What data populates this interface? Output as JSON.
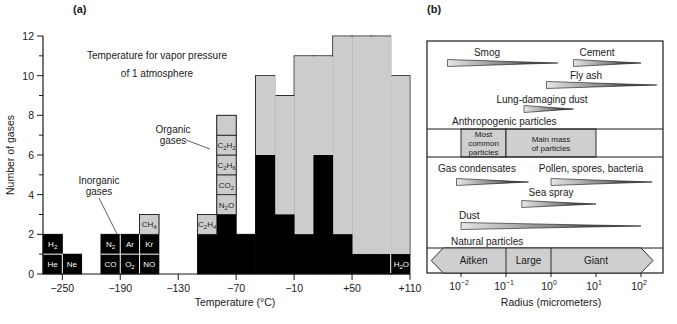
{
  "chart_data": [
    {
      "panel": "(a)",
      "type": "bar",
      "subtype": "stacked histogram",
      "title": "Temperature for vapor pressure of 1 atmosphere",
      "xlabel": "Temperature (°C)",
      "ylabel": "Number of gases",
      "xlim": [
        -270,
        110
      ],
      "ylim": [
        0,
        12
      ],
      "xticks": [
        -250,
        -190,
        -130,
        -70,
        -10,
        50,
        110
      ],
      "xtick_labels": [
        "−250",
        "−190",
        "−130",
        "−70",
        "−10",
        "+50",
        "+110"
      ],
      "yticks": [
        0,
        2,
        4,
        6,
        8,
        10,
        12
      ],
      "ytick_labels": [
        "0",
        "2",
        "4",
        "6",
        "8",
        "10",
        "12"
      ],
      "bin_width": 20,
      "bins": [
        {
          "x0": -270,
          "inorganic": 2,
          "organic": 0
        },
        {
          "x0": -250,
          "inorganic": 1,
          "organic": 0
        },
        {
          "x0": -210,
          "inorganic": 2,
          "organic": 0
        },
        {
          "x0": -190,
          "inorganic": 2,
          "organic": 0
        },
        {
          "x0": -170,
          "inorganic": 2,
          "organic": 1
        },
        {
          "x0": -110,
          "inorganic": 2,
          "organic": 1
        },
        {
          "x0": -90,
          "inorganic": 3,
          "organic": 5
        },
        {
          "x0": -70,
          "inorganic": 2,
          "organic": 0
        },
        {
          "x0": -50,
          "inorganic": 6,
          "organic": 4
        },
        {
          "x0": -30,
          "inorganic": 3,
          "organic": 6
        },
        {
          "x0": -10,
          "inorganic": 2,
          "organic": 9
        },
        {
          "x0": 10,
          "inorganic": 6,
          "organic": 5
        },
        {
          "x0": 30,
          "inorganic": 2,
          "organic": 10
        },
        {
          "x0": 50,
          "inorganic": 1,
          "organic": 11
        },
        {
          "x0": 70,
          "inorganic": 1,
          "organic": 11
        },
        {
          "x0": 90,
          "inorganic": 1,
          "organic": 9
        }
      ],
      "series": [
        {
          "name": "Inorganic gases",
          "color": "#000000"
        },
        {
          "name": "Organic gases",
          "color": "#cccccc"
        }
      ],
      "cell_labels": [
        {
          "x0": -270,
          "level": 0,
          "text": "He",
          "sub": ""
        },
        {
          "x0": -270,
          "level": 1,
          "text": "H",
          "sub": "2"
        },
        {
          "x0": -250,
          "level": 0,
          "text": "Ne",
          "sub": ""
        },
        {
          "x0": -210,
          "level": 0,
          "text": "CO",
          "sub": ""
        },
        {
          "x0": -210,
          "level": 1,
          "text": "N",
          "sub": "2"
        },
        {
          "x0": -190,
          "level": 0,
          "text": "O",
          "sub": "2"
        },
        {
          "x0": -190,
          "level": 1,
          "text": "Ar",
          "sub": ""
        },
        {
          "x0": -170,
          "level": 0,
          "text": "NO",
          "sub": ""
        },
        {
          "x0": -170,
          "level": 1,
          "text": "Kr",
          "sub": ""
        },
        {
          "x0": -170,
          "level": 2,
          "text": "CH",
          "sub": "4",
          "organic": true
        },
        {
          "x0": -110,
          "level": 2,
          "text": "C",
          "sub": "2",
          "tail": "H",
          "tsub": "4",
          "organic": true
        },
        {
          "x0": -90,
          "level": 3,
          "text": "N",
          "sub": "2",
          "tail": "O",
          "tsub": "",
          "organic": true
        },
        {
          "x0": -90,
          "level": 4,
          "text": "CO",
          "sub": "2",
          "organic": true
        },
        {
          "x0": -90,
          "level": 5,
          "text": "C",
          "sub": "2",
          "tail": "H",
          "tsub": "6",
          "organic": true
        },
        {
          "x0": -90,
          "level": 6,
          "text": "C",
          "sub": "2",
          "tail": "H",
          "tsub": "2",
          "organic": true
        }
      ],
      "h2o_label": {
        "text": "H",
        "sub": "2",
        "tail": "O"
      },
      "annotations": [
        {
          "text": "Inorganic gases",
          "lines": [
            "Inorganic",
            "gases"
          ]
        },
        {
          "text": "Organic gases",
          "lines": [
            "Organic",
            "gases"
          ]
        }
      ]
    },
    {
      "panel": "(b)",
      "type": "diagram",
      "xlabel": "Radius (micrometers)",
      "xscale": "log",
      "xlim_log10": [
        -2.75,
        2.5
      ],
      "xticks_log10": [
        -2,
        -1,
        0,
        1,
        2
      ],
      "xtick_base": "10",
      "xtick_exponents": [
        "−2",
        "−1",
        "0",
        "1",
        "2"
      ],
      "sections": {
        "anthropogenic": {
          "label": "Anthropogenic particles",
          "ranges": [
            {
              "name": "Smog",
              "from_log10": -2.3,
              "to_log10": 0.15
            },
            {
              "name": "Cement",
              "from_log10": 0.5,
              "to_log10": 2.0
            },
            {
              "name": "Fly ash",
              "from_log10": -0.1,
              "to_log10": 2.35
            },
            {
              "name": "Lung-damaging dust",
              "from_log10": -0.6,
              "to_log10": 0.5
            }
          ]
        },
        "band": [
          {
            "label_lines": [
              "Most",
              "common",
              "particles"
            ],
            "from_log10": -2,
            "to_log10": -1
          },
          {
            "label_lines": [
              "Main mass",
              "of particles"
            ],
            "from_log10": -1,
            "to_log10": 1
          }
        ],
        "natural": {
          "label": "Natural particles",
          "ranges": [
            {
              "name": "Gas condensates",
              "from_log10": -2.1,
              "to_log10": -0.5
            },
            {
              "name": "Pollen, spores, bacteria",
              "from_log10": 0.0,
              "to_log10": 2.25
            },
            {
              "name": "Sea spray",
              "from_log10": -0.65,
              "to_log10": 1.0
            },
            {
              "name": "Dust",
              "from_log10": -2.0,
              "to_log10": 2.0
            }
          ]
        },
        "size_classes": [
          {
            "name": "Aitken",
            "from_log10": -2.75,
            "to_log10": -1
          },
          {
            "name": "Large",
            "from_log10": -1,
            "to_log10": 0
          },
          {
            "name": "Giant",
            "from_log10": 0,
            "to_log10": 2.0
          }
        ]
      }
    }
  ],
  "colors": {
    "inorganic": "#000000",
    "organic": "#cccccc",
    "band": "#cfcfcf",
    "frame": "#1a1a1a"
  }
}
